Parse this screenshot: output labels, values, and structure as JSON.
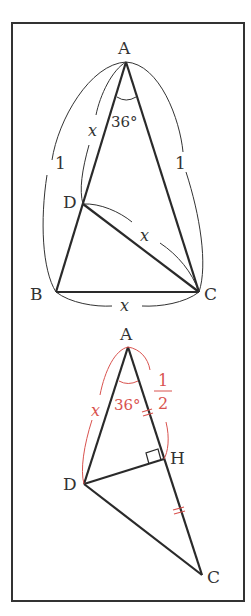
{
  "figure1": {
    "vertices": {
      "A": "A",
      "B": "B",
      "C": "C",
      "D": "D"
    },
    "angle_label": "36°",
    "side_AB_label": "1",
    "side_AC_label": "1",
    "side_AD_label": "x",
    "side_DC_label": "x",
    "side_BC_label": "x"
  },
  "figure2": {
    "vertices": {
      "A": "A",
      "C": "C",
      "D": "D",
      "H": "H"
    },
    "angle_label": "36°",
    "side_AD_label": "x",
    "half_numerator": "1",
    "half_denominator": "2"
  },
  "colors": {
    "line": "#2a2a2a",
    "annotation": "#d9534f",
    "frame": "#333333"
  }
}
